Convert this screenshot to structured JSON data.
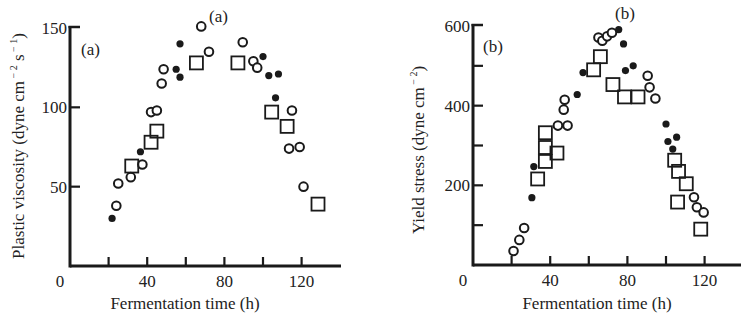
{
  "chart_data": [
    {
      "type": "scatter",
      "panel_label": "(a)",
      "panel_label_top": "(a)",
      "title": "",
      "xlabel": "Fermentation time (h)",
      "ylabel": "Plastic viscosity (dyne cm⁻² s⁻¹)",
      "ylabel_parts": {
        "main": "Plastic viscosity (dyne cm",
        "exp1": "− 2",
        "mid": " s",
        "exp2": "− 1",
        "end": ")"
      },
      "xlim": [
        0,
        140
      ],
      "ylim": [
        0,
        150
      ],
      "x_ticks": [
        20,
        40,
        60,
        80,
        100,
        120
      ],
      "x_tick_labels": [
        "0",
        "40",
        "80",
        "120"
      ],
      "x_tick_label_values": [
        0,
        40,
        80,
        120
      ],
      "y_ticks": [
        50,
        100,
        150
      ],
      "y_tick_labels": [
        "50",
        "100",
        "150"
      ],
      "grid": false,
      "legend": null,
      "series": [
        {
          "name": "open circles",
          "marker": "open-circle",
          "points": [
            [
              24,
              38
            ],
            [
              25,
              52
            ],
            [
              31.5,
              56
            ],
            [
              37.5,
              64
            ],
            [
              42,
              97
            ],
            [
              45,
              98
            ],
            [
              47.5,
              115
            ],
            [
              48.5,
              124
            ],
            [
              68,
              151
            ],
            [
              72,
              135
            ],
            [
              89.5,
              141
            ],
            [
              95,
              129
            ],
            [
              97,
              125
            ],
            [
              115,
              98
            ],
            [
              113.5,
              74
            ],
            [
              119,
              75
            ],
            [
              121,
              50
            ]
          ]
        },
        {
          "name": "filled circles",
          "marker": "filled-circle",
          "points": [
            [
              21.8,
              30
            ],
            [
              36.5,
              72
            ],
            [
              55,
              124
            ],
            [
              57,
              119
            ],
            [
              57,
              140
            ],
            [
              100,
              132
            ],
            [
              103,
              120
            ],
            [
              108,
              121
            ],
            [
              106.5,
              106
            ]
          ]
        },
        {
          "name": "open squares",
          "marker": "open-square",
          "points": [
            [
              32,
              63
            ],
            [
              42,
              78
            ],
            [
              45,
              85
            ],
            [
              65.5,
              128
            ],
            [
              87,
              128
            ],
            [
              104.5,
              97
            ],
            [
              112.5,
              88
            ],
            [
              128.5,
              39
            ]
          ]
        }
      ]
    },
    {
      "type": "scatter",
      "panel_label": "(b)",
      "panel_label_top": "(b)",
      "title": "",
      "xlabel": "Fermentation time (h)",
      "ylabel": "Yield stress (dyne cm⁻²)",
      "ylabel_parts": {
        "main": "Yield stress (dyne cm",
        "exp1": "− 2",
        "end": ")"
      },
      "xlim": [
        0,
        140
      ],
      "ylim": [
        0,
        600
      ],
      "x_ticks": [
        20,
        40,
        60,
        80,
        100,
        120
      ],
      "x_tick_labels": [
        "0",
        "40",
        "80",
        "120"
      ],
      "x_tick_label_values": [
        0,
        40,
        80,
        120
      ],
      "y_ticks": [
        100,
        200,
        300,
        400,
        500,
        600
      ],
      "y_tick_labels": [
        "200",
        "400",
        "600"
      ],
      "y_tick_label_values": [
        200,
        400,
        600
      ],
      "grid": false,
      "legend": null,
      "series": [
        {
          "name": "open circles",
          "marker": "open-circle",
          "points": [
            [
              21,
              35
            ],
            [
              24,
              63
            ],
            [
              26.5,
              93
            ],
            [
              44,
              350
            ],
            [
              49,
              350
            ],
            [
              47,
              390
            ],
            [
              47.5,
              415
            ],
            [
              65,
              571
            ],
            [
              67,
              563
            ],
            [
              69.5,
              574
            ],
            [
              72,
              583
            ],
            [
              90.5,
              475
            ],
            [
              91.5,
              446
            ],
            [
              94.5,
              418
            ],
            [
              114.5,
              170
            ],
            [
              116,
              145
            ],
            [
              119.5,
              132
            ]
          ]
        },
        {
          "name": "filled circles",
          "marker": "filled-circle",
          "points": [
            [
              30.5,
              169
            ],
            [
              31.5,
              247
            ],
            [
              54,
              428
            ],
            [
              57,
              483
            ],
            [
              75.5,
              591
            ],
            [
              78,
              555
            ],
            [
              79,
              488
            ],
            [
              83,
              500
            ],
            [
              100,
              354
            ],
            [
              101,
              310
            ],
            [
              105.5,
              321
            ],
            [
              103.5,
              291
            ]
          ]
        },
        {
          "name": "open squares",
          "marker": "open-square",
          "points": [
            [
              33.5,
              216
            ],
            [
              37.5,
              332
            ],
            [
              37.5,
              295
            ],
            [
              37.5,
              260
            ],
            [
              43.5,
              281
            ],
            [
              62.5,
              490
            ],
            [
              66,
              523
            ],
            [
              72.5,
              453
            ],
            [
              78.5,
              422
            ],
            [
              85.5,
              422
            ],
            [
              104.5,
              263
            ],
            [
              106.5,
              235
            ],
            [
              110.5,
              204
            ],
            [
              106,
              158
            ],
            [
              118,
              90
            ]
          ]
        }
      ]
    }
  ]
}
